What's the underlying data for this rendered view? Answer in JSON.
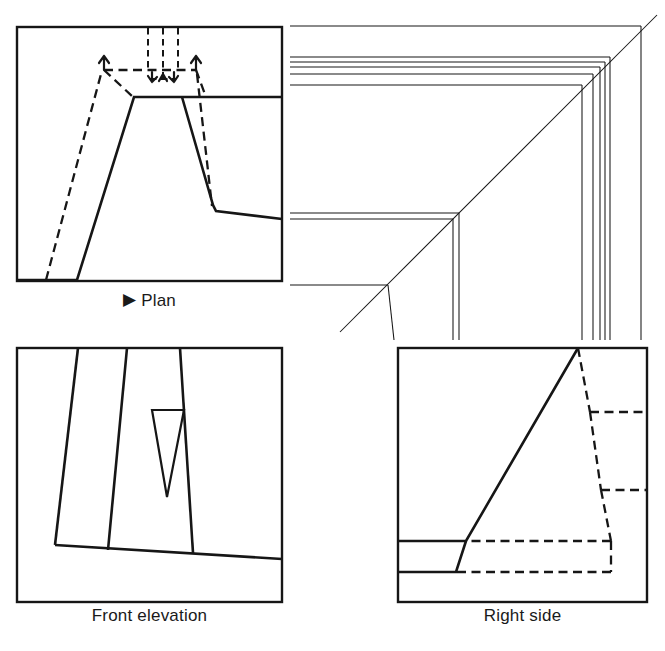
{
  "plate": {
    "title": "Orthographic projection exercise plate",
    "background_color": "#ffffff",
    "ink_color": "#161616",
    "width": 665,
    "height": 651
  },
  "panels": [
    {
      "id": "plan",
      "caption": "Plan",
      "marker": "▶",
      "has_marker": true,
      "frame": {
        "x": 17,
        "y": 27,
        "w": 265,
        "h": 254
      },
      "description": "Top view showing tapered block outline with hidden slot detail and directional arrows"
    },
    {
      "id": "pictorial",
      "caption": "",
      "marker": "",
      "has_marker": false,
      "frame": {
        "x": 290,
        "y": 0,
        "w": 375,
        "h": 335
      },
      "description": "Unframed pictorial corner construction of nested mitred frame profiles"
    },
    {
      "id": "front-elevation",
      "caption": "Front elevation",
      "marker": "",
      "has_marker": false,
      "frame": {
        "x": 17,
        "y": 348,
        "w": 265,
        "h": 254
      },
      "description": "Front view with three tapered faces and a small inverted triangular opening"
    },
    {
      "id": "right-side",
      "caption": "Right side",
      "marker": "",
      "has_marker": false,
      "frame": {
        "x": 398,
        "y": 348,
        "w": 249,
        "h": 254
      },
      "description": "Right side view with steeply inclined solid face and hidden stepped outline"
    }
  ],
  "captions": {
    "plan": "Plan",
    "front_elevation": "Front elevation",
    "right_side": "Right side",
    "plan_marker": "▶"
  },
  "geometry": {
    "plan": {
      "frame": [
        [
          17,
          27
        ],
        [
          282,
          27
        ],
        [
          282,
          281
        ],
        [
          17,
          281
        ]
      ],
      "solid_paths": [
        "M 17 280 L 77 280 L 135 98 L 207 98 L 282 98",
        "M 207 98 L 218 211 L 282 219",
        "M 182 98 L 214 206"
      ],
      "hidden_paths": [
        "M 104 70 L 182 70 L 196 70",
        "M 104 70 L 135 98",
        "M 196 70 L 207 98",
        "M 46 280 L 104 70",
        "M 196 70 L 212 206",
        "M 150 27 L 150 70",
        "M 163 27 L 163 76",
        "M 176 27 L 176 70",
        "M 150 76 L 176 76"
      ],
      "arrows": [
        {
          "at": [
            104,
            70
          ],
          "dir": "up-left"
        },
        {
          "at": [
            196,
            70
          ],
          "dir": "up-right"
        },
        {
          "at": [
            152,
            78
          ],
          "dir": "down-left"
        },
        {
          "at": [
            174,
            78
          ],
          "dir": "down-right"
        }
      ]
    },
    "pictorial": {
      "miter_diagonal": [
        [
          340,
          330
        ],
        [
          657,
          16
        ]
      ],
      "top_horizontals_y": [
        26,
        57,
        62,
        67,
        74,
        85,
        213,
        219,
        285
      ],
      "right_verticals_x": [
        589,
        585,
        580,
        575,
        570,
        458,
        452,
        398
      ],
      "note": "Nested frame profile lines converging on a 45 degree miter line"
    },
    "front_elevation": {
      "frame": [
        [
          17,
          348
        ],
        [
          282,
          348
        ],
        [
          282,
          602
        ],
        [
          17,
          602
        ]
      ],
      "solid_paths": [
        "M 78 348 L 56 545 L 282 558",
        "M 127 348 L 106 548",
        "M 180 348 L 192 545"
      ],
      "triangle": [
        [
          153,
          410
        ],
        [
          184,
          410
        ],
        [
          167,
          497
        ]
      ]
    },
    "right_side": {
      "frame": [
        [
          398,
          348
        ],
        [
          647,
          348
        ],
        [
          647,
          602
        ],
        [
          398,
          348
        ]
      ],
      "solid_paths": [
        "M 398 541 L 466 541 L 578 348",
        "M 398 572 L 456 572 L 466 541"
      ],
      "hidden_paths": [
        "M 578 348 L 590 412 L 647 412",
        "M 590 412 L 600 490 L 647 490",
        "M 600 490 L 610 541 L 466 541",
        "M 610 541 L 610 572 L 456 572"
      ]
    }
  }
}
